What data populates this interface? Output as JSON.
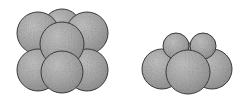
{
  "figure": {
    "background_color": "#ffffff",
    "width": 244,
    "height": 100,
    "sphere_fill_color": "#a8a8a8",
    "sphere_fill_light": "#c2c2c2",
    "sphere_outline_color": "#3a3a3a",
    "speckle_color": "#6e6e6e",
    "outline_width": 1
  },
  "clusters": [
    {
      "id": "left-cluster",
      "name": "seven-sphere-cluster",
      "label": "",
      "sphere_count": 7,
      "bounds": {
        "x": 17,
        "y": 9,
        "width": 92,
        "height": 84
      },
      "spheres": [
        {
          "id": "L-back-center",
          "name": "sphere-back-center",
          "cx": 62,
          "cy": 28,
          "r": 19,
          "layer": "back",
          "z": 1
        },
        {
          "id": "L-top-left",
          "name": "sphere-top-left",
          "cx": 38,
          "cy": 33,
          "r": 21,
          "layer": "mid",
          "z": 2
        },
        {
          "id": "L-top-right",
          "name": "sphere-top-right",
          "cx": 87,
          "cy": 33,
          "r": 21,
          "layer": "mid",
          "z": 2
        },
        {
          "id": "L-bottom-left",
          "name": "sphere-bottom-left",
          "cx": 38,
          "cy": 70,
          "r": 21,
          "layer": "mid",
          "z": 2
        },
        {
          "id": "L-bottom-right",
          "name": "sphere-bottom-right",
          "cx": 87,
          "cy": 70,
          "r": 21,
          "layer": "mid",
          "z": 2
        },
        {
          "id": "L-front-upper",
          "name": "sphere-front-upper",
          "cx": 62,
          "cy": 44,
          "r": 22,
          "layer": "front",
          "z": 3
        },
        {
          "id": "L-front-lower",
          "name": "sphere-front-lower",
          "cx": 62,
          "cy": 72,
          "r": 21,
          "layer": "front",
          "z": 3
        }
      ]
    },
    {
      "id": "right-cluster",
      "name": "six-sphere-cluster",
      "label": "",
      "sphere_count": 6,
      "bounds": {
        "x": 142,
        "y": 33,
        "width": 90,
        "height": 60
      },
      "spheres": [
        {
          "id": "R-top-left",
          "name": "sphere-top-small-left",
          "cx": 176,
          "cy": 46,
          "r": 13,
          "layer": "top",
          "z": 2
        },
        {
          "id": "R-top-right",
          "name": "sphere-top-small-right",
          "cx": 203,
          "cy": 46,
          "r": 13,
          "layer": "top",
          "z": 2
        },
        {
          "id": "R-back-left",
          "name": "sphere-back-left",
          "cx": 162,
          "cy": 69,
          "r": 20,
          "layer": "back",
          "z": 1
        },
        {
          "id": "R-back-center",
          "name": "sphere-back-center",
          "cx": 189,
          "cy": 62,
          "r": 19,
          "layer": "back",
          "z": 1
        },
        {
          "id": "R-back-right",
          "name": "sphere-back-right",
          "cx": 212,
          "cy": 69,
          "r": 20,
          "layer": "back",
          "z": 1
        },
        {
          "id": "R-front",
          "name": "sphere-front-center",
          "cx": 188,
          "cy": 72,
          "r": 22,
          "layer": "front",
          "z": 3
        }
      ]
    }
  ]
}
